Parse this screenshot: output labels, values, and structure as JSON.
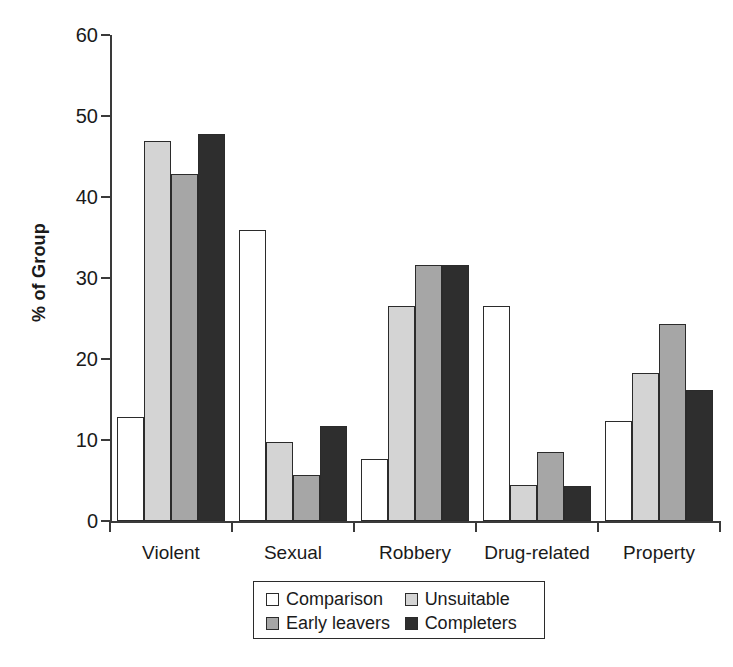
{
  "chart_data": {
    "type": "bar",
    "title": "",
    "subtitle": "",
    "xlabel": "",
    "ylabel": "% of Group",
    "categories": [
      "Violent",
      "Sexual",
      "Robbery",
      "Drug-related",
      "Property"
    ],
    "series": [
      {
        "name": "Comparison",
        "color": "#ffffff",
        "values": [
          12.9,
          35.9,
          7.7,
          26.5,
          12.3
        ]
      },
      {
        "name": "Unsuitable",
        "color": "#d4d4d4",
        "values": [
          46.9,
          9.8,
          26.6,
          4.4,
          18.3
        ]
      },
      {
        "name": "Early leavers",
        "color": "#a6a6a6",
        "values": [
          42.9,
          5.7,
          31.6,
          8.5,
          24.3
        ]
      },
      {
        "name": "Completers",
        "color": "#2e2e2e",
        "values": [
          47.8,
          11.7,
          31.6,
          4.3,
          16.2
        ]
      }
    ],
    "ylim": [
      0,
      60
    ],
    "yticks": [
      0,
      10,
      20,
      30,
      40,
      50,
      60
    ],
    "ytick_labels": [
      "0",
      "10",
      "20",
      "30",
      "40",
      "50",
      "60"
    ],
    "grid": false,
    "legend_position": "bottom-center",
    "legend_entries": [
      "Comparison",
      "Unsuitable",
      "Early leavers",
      "Completers"
    ]
  }
}
